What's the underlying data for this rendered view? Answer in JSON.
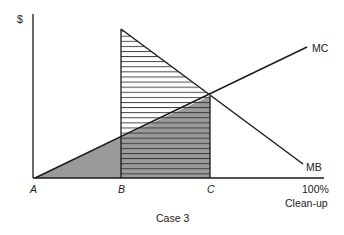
{
  "diagram": {
    "title": "Case 3",
    "y_axis_label": "$",
    "x_axis_label": "Clean-up",
    "x_axis_end_label": "100%",
    "points": {
      "A": "A",
      "B": "B",
      "C": "C"
    },
    "curves": {
      "mc": "MC",
      "mb": "MB"
    },
    "regions": [
      {
        "name": "cost-triangle-A-B",
        "fill": "gray"
      },
      {
        "name": "benefit-triangle-B-C",
        "fill": "horizontal-hatch"
      },
      {
        "name": "cost-region-B-C",
        "fill": "gray-with-hatch"
      }
    ],
    "colors": {
      "line": "#1a1a1a",
      "gray_fill": "#9a9a9a",
      "hatch": "#333333",
      "background": "#ffffff"
    }
  }
}
